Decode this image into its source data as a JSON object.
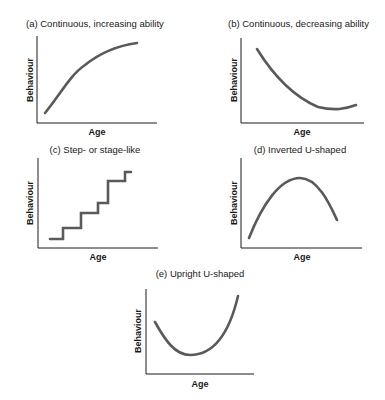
{
  "figure": {
    "panels": [
      {
        "id": "a",
        "title": "(a) Continuous, increasing ability",
        "xlabel": "Age",
        "ylabel": "Behaviour"
      },
      {
        "id": "b",
        "title": "(b) Continuous, decreasing ability",
        "xlabel": "Age",
        "ylabel": "Behaviour"
      },
      {
        "id": "c",
        "title": "(c) Step- or stage-like",
        "xlabel": "Age",
        "ylabel": "Behaviour"
      },
      {
        "id": "d",
        "title": "(d) Inverted U-shaped",
        "xlabel": "Age",
        "ylabel": "Behaviour"
      },
      {
        "id": "e",
        "title": "(e) Upright U-shaped",
        "xlabel": "Age",
        "ylabel": "Behaviour"
      }
    ],
    "colors": {
      "axis": "#1a1a1a",
      "curve": "#5a5a5a",
      "text": "#1a1a1a"
    }
  }
}
